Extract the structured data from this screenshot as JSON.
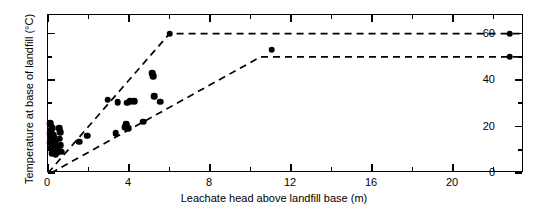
{
  "chart_data": {
    "type": "scatter",
    "title": "",
    "xlabel": "Leachate head above landfill base (m)",
    "ylabel": "Temperature at base of landfill (°C)",
    "xlim": [
      0,
      23.5
    ],
    "ylim": [
      0,
      68
    ],
    "grid": false,
    "legend": "none",
    "xticks_major": [
      0,
      4,
      8,
      12,
      16,
      20
    ],
    "xticks_major_labels": [
      "0",
      "4",
      "8",
      "12",
      "16",
      "20"
    ],
    "xticks_minor": [
      2,
      6,
      10,
      14,
      18,
      22
    ],
    "yticks_major": [
      0,
      20,
      40,
      60
    ],
    "yticks_major_labels": [
      "0",
      "20",
      "40",
      "60"
    ],
    "yticks_minor": [
      10,
      30,
      50
    ],
    "series": [
      {
        "name": "Measured landfill temperatures",
        "marker": "filled-circle",
        "color": "#000000",
        "points": [
          [
            0.12,
            21.5
          ],
          [
            0.18,
            20.0
          ],
          [
            0.15,
            18.6
          ],
          [
            0.22,
            19.4
          ],
          [
            0.1,
            17.2
          ],
          [
            0.26,
            16.4
          ],
          [
            0.14,
            15.5
          ],
          [
            0.3,
            15.0
          ],
          [
            0.18,
            14.2
          ],
          [
            0.35,
            13.6
          ],
          [
            0.12,
            13.0
          ],
          [
            0.28,
            12.4
          ],
          [
            0.2,
            11.8
          ],
          [
            0.4,
            11.2
          ],
          [
            0.16,
            10.6
          ],
          [
            0.33,
            10.0
          ],
          [
            0.24,
            9.4
          ],
          [
            0.45,
            9.0
          ],
          [
            0.2,
            8.4
          ],
          [
            0.38,
            8.0
          ],
          [
            0.55,
            19.2
          ],
          [
            0.6,
            17.6
          ],
          [
            0.58,
            14.8
          ],
          [
            0.62,
            12.0
          ],
          [
            0.52,
            10.4
          ],
          [
            0.68,
            9.2
          ],
          [
            1.55,
            13.4
          ],
          [
            1.95,
            16.0
          ],
          [
            2.95,
            31.5
          ],
          [
            3.35,
            17.2
          ],
          [
            3.45,
            30.5
          ],
          [
            3.8,
            19.8
          ],
          [
            3.85,
            21.0
          ],
          [
            3.9,
            30.2
          ],
          [
            3.95,
            19.4
          ],
          [
            4.05,
            30.8
          ],
          [
            4.25,
            31.0
          ],
          [
            4.7,
            22.0
          ],
          [
            5.15,
            43.0
          ],
          [
            5.2,
            41.6
          ],
          [
            5.25,
            33.0
          ],
          [
            5.55,
            30.6
          ],
          [
            6.0,
            60.0
          ],
          [
            11.05,
            53.0
          ],
          [
            22.8,
            60.0
          ],
          [
            22.8,
            50.0
          ]
        ]
      }
    ],
    "annotations": [
      {
        "name": "upper-bound",
        "style": "dashed",
        "vertices": [
          [
            0.0,
            0.0
          ],
          [
            6.0,
            60.0
          ],
          [
            23.5,
            60.0
          ]
        ]
      },
      {
        "name": "lower-bound",
        "style": "dashed",
        "vertices": [
          [
            0.15,
            0.0
          ],
          [
            10.5,
            50.0
          ],
          [
            23.5,
            50.0
          ]
        ]
      }
    ]
  }
}
